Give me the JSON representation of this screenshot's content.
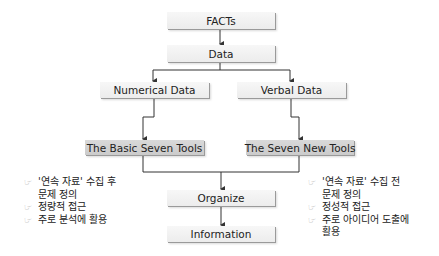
{
  "diagram": {
    "nodes": {
      "facts": "FACTs",
      "data": "Data",
      "numerical": "Numerical Data",
      "verbal": "Verbal Data",
      "basic_seven": "The Basic Seven Tools",
      "seven_new": "The Seven New Tools",
      "organize": "Organize",
      "information": "Information"
    },
    "edges": [
      {
        "from": "FACTs",
        "to": "Data"
      },
      {
        "from": "Data",
        "to": "Numerical Data"
      },
      {
        "from": "Data",
        "to": "Verbal Data"
      },
      {
        "from": "Numerical Data",
        "to": "The Basic Seven Tools"
      },
      {
        "from": "Verbal Data",
        "to": "The Seven New Tools"
      },
      {
        "from": "The Basic Seven Tools",
        "to": "Organize"
      },
      {
        "from": "The Seven New Tools",
        "to": "Organize"
      },
      {
        "from": "Organize",
        "to": "Information"
      }
    ],
    "left_notes": {
      "bullet": "☞",
      "items": [
        "'연속 자료' 수집 후\n문제 정의",
        "정량적 접근",
        "주로 분석에 활용"
      ]
    },
    "right_notes": {
      "bullet": "☞",
      "items": [
        "'연속 자료' 수집 전\n문제 정의",
        "정성적 접근",
        "주로 아이디어 도출에\n활용"
      ]
    },
    "colors": {
      "box_fill": "#f0f0f0",
      "tool_box_fill": "#d0d0d0",
      "line": "#333333",
      "bullet": "#9a9a9a"
    }
  }
}
